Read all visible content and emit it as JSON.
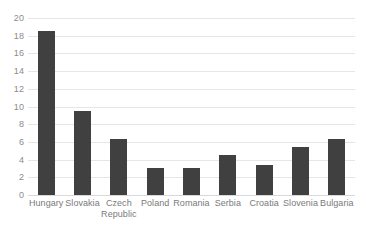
{
  "chart_data": {
    "type": "bar",
    "title": "",
    "xlabel": "",
    "ylabel": "",
    "ylim": [
      0,
      20
    ],
    "yticks": [
      0,
      2,
      4,
      6,
      8,
      10,
      12,
      14,
      16,
      18,
      20
    ],
    "grid": true,
    "legend": false,
    "bar_color": "#404040",
    "gridline_color": "#e6e6e6",
    "background_color": "#ffffff",
    "tick_label_color": "#8c8c8c",
    "categories": [
      "Hungary",
      "Slovakia",
      "Czech Republic",
      "Poland",
      "Romania",
      "Serbia",
      "Croatia",
      "Slovenia",
      "Bulgaria"
    ],
    "values": [
      18.5,
      9.5,
      6.3,
      3.0,
      3.0,
      4.5,
      3.4,
      5.4,
      6.3
    ]
  }
}
